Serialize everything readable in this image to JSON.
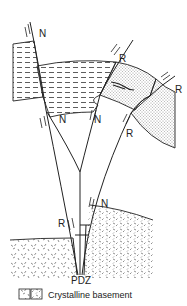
{
  "diagram": {
    "type": "fault-structure-cross-section",
    "fault_labels": {
      "n1": "N",
      "n2": "N",
      "n3": "N",
      "n4": "N",
      "r1": "R",
      "r2": "R",
      "r3": "R",
      "r4": "R"
    },
    "bottom_label": "PDZ",
    "legend": {
      "label": "Crystalline basement"
    },
    "units": [
      {
        "name": "dashed-sediment-layer",
        "pattern": "dashes"
      },
      {
        "name": "stippled-sand-layer",
        "pattern": "dots"
      },
      {
        "name": "crystalline-basement",
        "pattern": "ticks"
      }
    ],
    "colors": {
      "line": "#222222",
      "background": "#ffffff"
    }
  }
}
